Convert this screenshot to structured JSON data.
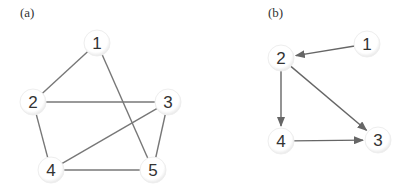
{
  "colors": {
    "edge": "#777777",
    "node_fill": "#ffffff",
    "node_shadow": "#e6e6e6",
    "text": "#333333"
  },
  "panels": [
    {
      "label": "(a)",
      "directed": false,
      "nodes": [
        {
          "id": "1",
          "label": "1",
          "x": 97,
          "y": 43
        },
        {
          "id": "2",
          "label": "2",
          "x": 33,
          "y": 102
        },
        {
          "id": "3",
          "label": "3",
          "x": 168,
          "y": 102
        },
        {
          "id": "4",
          "label": "4",
          "x": 51,
          "y": 170
        },
        {
          "id": "5",
          "label": "5",
          "x": 153,
          "y": 170
        }
      ],
      "edges": [
        {
          "from": "1",
          "to": "2"
        },
        {
          "from": "1",
          "to": "5"
        },
        {
          "from": "2",
          "to": "3"
        },
        {
          "from": "2",
          "to": "4"
        },
        {
          "from": "3",
          "to": "4"
        },
        {
          "from": "3",
          "to": "5"
        },
        {
          "from": "4",
          "to": "5"
        }
      ]
    },
    {
      "label": "(b)",
      "directed": true,
      "nodes": [
        {
          "id": "1",
          "label": "1",
          "x": 367,
          "y": 44
        },
        {
          "id": "2",
          "label": "2",
          "x": 281,
          "y": 58
        },
        {
          "id": "3",
          "label": "3",
          "x": 378,
          "y": 140
        },
        {
          "id": "4",
          "label": "4",
          "x": 281,
          "y": 141
        }
      ],
      "edges": [
        {
          "from": "1",
          "to": "2"
        },
        {
          "from": "2",
          "to": "4"
        },
        {
          "from": "2",
          "to": "3"
        },
        {
          "from": "4",
          "to": "3"
        }
      ]
    }
  ]
}
